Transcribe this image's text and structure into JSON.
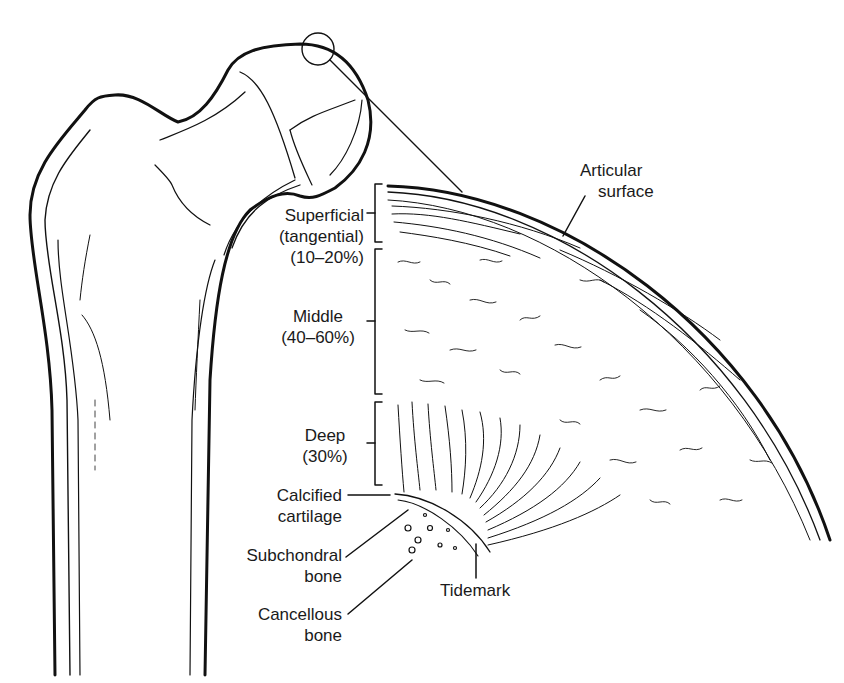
{
  "figure": {
    "labels": {
      "articular_surface": [
        "Articular",
        "surface"
      ],
      "superficial": [
        "Superficial",
        "(tangential)",
        "(10–20%)"
      ],
      "middle": [
        "Middle",
        "(40–60%)"
      ],
      "deep": [
        "Deep",
        "(30%)"
      ],
      "calcified": [
        "Calcified",
        "cartilage"
      ],
      "subchondral": [
        "Subchondral",
        "bone"
      ],
      "cancellous": [
        "Cancellous",
        "bone"
      ],
      "tidemark": "Tidemark"
    },
    "colors": {
      "line": "#111111",
      "background": "#ffffff"
    }
  }
}
